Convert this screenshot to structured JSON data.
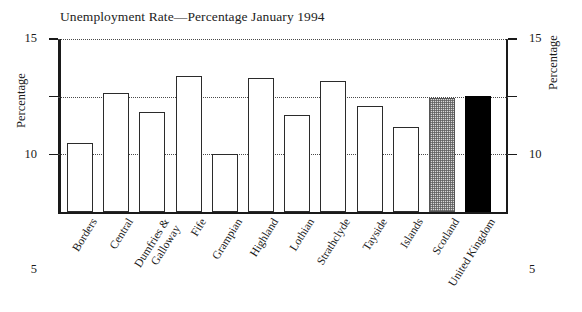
{
  "chart_data": {
    "type": "bar",
    "title": "Unemployment Rate—Percentage January 1994",
    "xlabel": "",
    "ylabel": "Percentage",
    "ylabel_right": "Percentage",
    "ylim": [
      0,
      15
    ],
    "yticks": [
      5,
      10,
      15
    ],
    "ytick_labels": [
      "5",
      "10",
      "15"
    ],
    "grid": true,
    "legend": "none",
    "categories": [
      "Borders",
      "Central",
      "Dumfries & Galloway",
      "Fife",
      "Grampian",
      "Highland",
      "Lothian",
      "Strathclyde",
      "Tayside",
      "Islands",
      "Scotland",
      "United Kingdom"
    ],
    "category_lines": [
      [
        "Borders"
      ],
      [
        "Central"
      ],
      [
        "Dumfries &",
        "Galloway"
      ],
      [
        "Fife"
      ],
      [
        "Grampian"
      ],
      [
        "Highland"
      ],
      [
        "Lothian"
      ],
      [
        "Strathclyde"
      ],
      [
        "Tayside"
      ],
      [
        "Islands"
      ],
      [
        "Scotland"
      ],
      [
        "United Kingdom"
      ]
    ],
    "values": [
      6.0,
      10.3,
      8.7,
      11.8,
      5.0,
      11.6,
      8.4,
      11.4,
      9.2,
      7.4,
      9.9,
      10.1
    ],
    "bar_styles": [
      "open",
      "open",
      "open",
      "open",
      "open",
      "open",
      "open",
      "open",
      "open",
      "open",
      "hatch",
      "black"
    ]
  },
  "colors": {
    "axis": "#1a1a1a",
    "grid": "#4a4a4a",
    "bar_outline": "#2b2b2b",
    "bar_fill_open": "#ffffff",
    "bar_fill_hatch": "#d8d8d8",
    "bar_fill_black": "#000000",
    "background": "#ffffff"
  }
}
